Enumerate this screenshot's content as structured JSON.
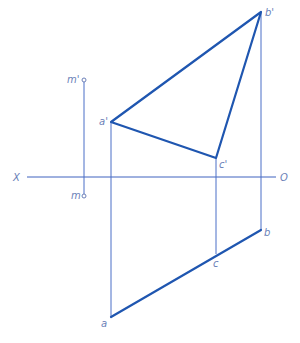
{
  "diagram": {
    "type": "orthographic projection (descriptive geometry)",
    "axis": {
      "left_label": "X",
      "right_label": "O"
    },
    "points": {
      "b_prime": {
        "label": "b'"
      },
      "a_prime": {
        "label": "a'"
      },
      "c_prime": {
        "label": "c'"
      },
      "m_prime": {
        "label": "m'"
      },
      "m": {
        "label": "m"
      },
      "a": {
        "label": "a"
      },
      "b": {
        "label": "b"
      },
      "c": {
        "label": "c"
      }
    },
    "elements": {
      "front_view": "triangle a'b'c'",
      "top_view": "line a-c-b (triangle projects as a line)",
      "point_m": "separate point m / m' with projection line"
    },
    "colors": {
      "thick_line": "#1f56b0",
      "thin_line": "#4a6fc7",
      "label": "#6b7fb8",
      "background": "#ffffff"
    }
  }
}
